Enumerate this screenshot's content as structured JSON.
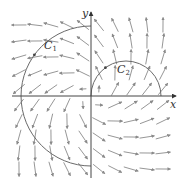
{
  "figure": {
    "type": "vector-field-with-curves",
    "field": "F(x, y) = (x - y, x + y)",
    "axes": {
      "x_label": "x",
      "y_label": "y",
      "origin_px": [
        91,
        96
      ],
      "x_range_px": [
        12,
        176
      ],
      "y_range_px": [
        12,
        178
      ]
    },
    "grid": {
      "cols_px": [
        19,
        35,
        51,
        67,
        83,
        99,
        115,
        131,
        147,
        163
      ],
      "rows_px": [
        25,
        41,
        57,
        73,
        89,
        105,
        121,
        137,
        153,
        169
      ],
      "unit_px": 16,
      "scale": 0.9,
      "max_len_px": 15,
      "arrow_color": "#8a8a8a"
    },
    "curves": [
      {
        "name": "C1",
        "label": "C",
        "subscript": "1",
        "description": "left semicircle from top of y-axis, counter-clockwise to bottom",
        "center_px": [
          91,
          96
        ],
        "radius_px": 70,
        "from_deg": 90,
        "to_deg": 270,
        "label_pos_px": [
          44,
          40
        ],
        "color": "#6a6a6a"
      },
      {
        "name": "C2",
        "label": "C",
        "subscript": "2",
        "description": "upper semicircle from origin to positive x-axis, clockwise",
        "center_px": [
          126,
          96
        ],
        "radius_px": 35,
        "from_deg": 180,
        "to_deg": 0,
        "label_pos_px": [
          117,
          64
        ],
        "color": "#6a6a6a"
      }
    ]
  }
}
